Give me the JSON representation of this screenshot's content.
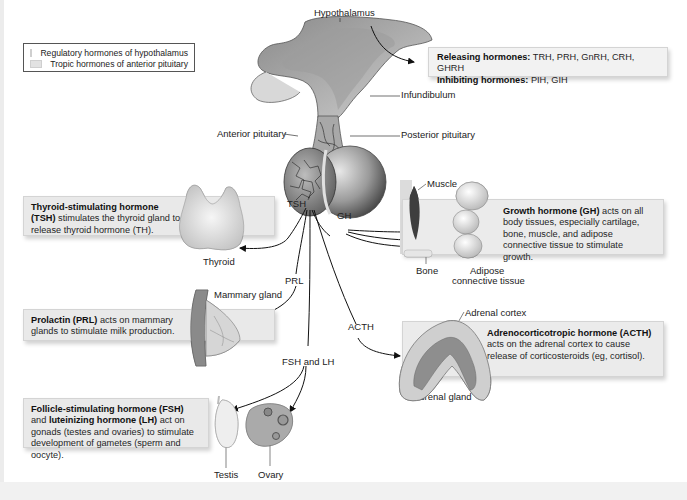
{
  "legend": {
    "items": [
      {
        "label": "Regulatory hormones of hypothalamus",
        "swatch": "#efefef"
      },
      {
        "label": "Tropic hormones of anterior pituitary",
        "swatch": "#e2e2e2"
      }
    ]
  },
  "structures": {
    "hypothalamus": "Hypothalamus",
    "infundibulum": "Infundibulum",
    "anterior_pituitary": "Anterior pituitary",
    "posterior_pituitary": "Posterior pituitary",
    "thyroid": "Thyroid",
    "mammary_gland": "Mammary gland",
    "muscle": "Muscle",
    "bone": "Bone",
    "adipose_line1": "Adipose",
    "adipose_line2": "connective tissue",
    "adrenal_cortex": "Adrenal cortex",
    "adrenal_gland": "Adrenal gland",
    "testis": "Testis",
    "ovary": "Ovary"
  },
  "arrows": {
    "tsh": "TSH",
    "gh": "GH",
    "prl": "PRL",
    "acth": "ACTH",
    "fsh_lh": "FSH and LH"
  },
  "boxes": {
    "hypothalamic": {
      "releasing_bold": "Releasing hormones:",
      "releasing_text": " TRH, PRH, GnRH, CRH, GHRH",
      "inhibiting_bold": "Inhibiting hormones:",
      "inhibiting_text": " PIH, GIH"
    },
    "tsh": {
      "bold1": "Thyroid-stimulating hormone",
      "bold2": "(TSH)",
      "text": " stimulates the thyroid gland to release thyroid hormone (TH)."
    },
    "prl": {
      "bold": "Prolactin (PRL)",
      "text": " acts on mammary glands to stimulate milk production."
    },
    "fsh_lh": {
      "bold1": "Follicle-stimulating hormone (FSH)",
      "text1": "and ",
      "bold2": "luteinizing hormone (LH)",
      "text2": " act on gonads (testes and ovaries) to stimulate development of gametes (sperm and oocyte)."
    },
    "gh": {
      "bold": "Growth hormone (GH)",
      "text": " acts on all body tissues, especially cartilage, bone, muscle, and adipose connective tissue to stimulate growth."
    },
    "acth": {
      "bold": "Adrenocorticotropic hormone (ACTH)",
      "text": " acts on the adrenal cortex to cause release of corticosteroids (eg, cortisol)."
    }
  }
}
